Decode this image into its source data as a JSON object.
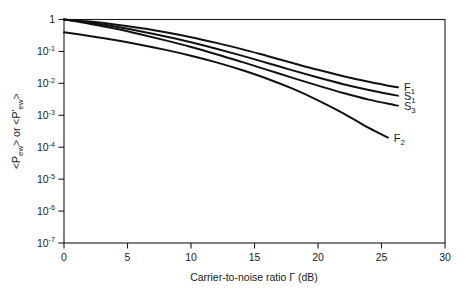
{
  "chart_data": {
    "type": "line",
    "title": "",
    "xlabel": "Carrier-to-noise ratio Γ (dB)",
    "ylabel": "<Pₑᵥᵥ> or <P'ₑᵥᵥ>",
    "ylabel_parts": {
      "prefix": "<P",
      "sub1": "ew",
      "mid": "> or <P'",
      "sub2": "ew",
      "suffix": ">"
    },
    "xlim": [
      0,
      30
    ],
    "xticks": [
      0,
      5,
      10,
      15,
      20,
      25,
      30
    ],
    "xtick_labels": [
      "0",
      "5",
      "10",
      "15",
      "20",
      "25",
      "30"
    ],
    "yscale": "log",
    "ylim": [
      1e-07,
      1
    ],
    "yticks": [
      1,
      0.1,
      0.01,
      0.001,
      0.0001,
      1e-05,
      1e-06,
      1e-07
    ],
    "ytick_labels": [
      "1",
      "10⁻¹",
      "10⁻²",
      "10⁻³",
      "10⁻⁴",
      "10⁻⁵",
      "10⁻⁶",
      "10⁻⁷"
    ],
    "ytick_mantissa": [
      "1",
      "10",
      "10",
      "10",
      "10",
      "10",
      "10",
      "10"
    ],
    "ytick_exponent": [
      "",
      "-1",
      "-2",
      "-3",
      "-4",
      "-5",
      "-6",
      "-7"
    ],
    "grid": false,
    "legend_position": "inline-right-end-labels",
    "series": [
      {
        "name": "F1",
        "label_base": "F",
        "label_sub": "1",
        "color": "#111111",
        "x": [
          0,
          2,
          4,
          6,
          8,
          10,
          12,
          14,
          16,
          18,
          20,
          22,
          24,
          26,
          26.3
        ],
        "y": [
          1.0,
          0.86,
          0.7,
          0.54,
          0.4,
          0.28,
          0.185,
          0.118,
          0.072,
          0.0435,
          0.0265,
          0.0168,
          0.0112,
          0.0078,
          0.0075
        ]
      },
      {
        "name": "S1",
        "label_base": "S",
        "label_sub": "1",
        "color": "#111111",
        "x": [
          0,
          2,
          4,
          6,
          8,
          10,
          12,
          14,
          16,
          18,
          20,
          22,
          24,
          26,
          26.3
        ],
        "y": [
          1.0,
          0.8,
          0.6,
          0.43,
          0.295,
          0.195,
          0.122,
          0.074,
          0.0435,
          0.0255,
          0.0152,
          0.0094,
          0.0062,
          0.0043,
          0.0041
        ]
      },
      {
        "name": "S3",
        "label_base": "S",
        "label_sub": "3",
        "color": "#111111",
        "x": [
          0,
          2,
          4,
          6,
          8,
          10,
          12,
          14,
          16,
          18,
          20,
          22,
          24,
          26,
          26.3
        ],
        "y": [
          1.0,
          0.74,
          0.52,
          0.345,
          0.222,
          0.138,
          0.082,
          0.047,
          0.0265,
          0.0148,
          0.0085,
          0.005,
          0.0031,
          0.0021,
          0.002
        ]
      },
      {
        "name": "F2",
        "label_base": "F",
        "label_sub": "2",
        "color": "#111111",
        "x": [
          0,
          2,
          4,
          6,
          8,
          10,
          12,
          14,
          16,
          18,
          20,
          22,
          24,
          25.5
        ],
        "y": [
          0.4,
          0.305,
          0.228,
          0.163,
          0.112,
          0.0735,
          0.0455,
          0.0262,
          0.014,
          0.0068,
          0.00295,
          0.00115,
          0.0004,
          0.0002
        ]
      }
    ],
    "curve_end_labels": [
      {
        "name": "F1",
        "base": "F",
        "sub": "1"
      },
      {
        "name": "S1",
        "base": "S",
        "sub": "1"
      },
      {
        "name": "S3",
        "base": "S",
        "sub": "3"
      },
      {
        "name": "F2",
        "base": "F",
        "sub": "2"
      }
    ]
  }
}
